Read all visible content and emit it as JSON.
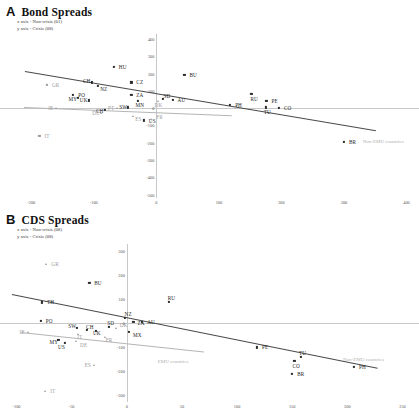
{
  "figure": {
    "panels": [
      {
        "letter": "A",
        "title": "Bond Spreads",
        "note_x": "x axis - Non-crisis (01)",
        "note_y": "y axis - Crisis (08)",
        "group_labels": {
          "non_emu": "Non-EMU countries",
          "emu": ""
        }
      },
      {
        "letter": "B",
        "title": "CDS Spreads",
        "note_x": "x axis - Non-crisis (08)",
        "note_y": "y axis - Crisis (08)",
        "group_labels": {
          "non_emu": "Non-EMU countries",
          "emu": "EMU countries"
        }
      }
    ]
  },
  "chart_data": [
    {
      "type": "scatter",
      "title": "Bond Spreads",
      "xlabel": "x axis - Non-crisis (01)",
      "ylabel": "y axis - Crisis (08)",
      "xlim": [
        -250,
        420
      ],
      "ylim": [
        -520,
        430
      ],
      "xticks": [
        -200,
        -100,
        0,
        100,
        200,
        300,
        400
      ],
      "yticks": [
        400,
        300,
        200,
        100,
        0,
        -100,
        -200,
        -300,
        -400,
        -500
      ],
      "grid": false,
      "legend": "none",
      "points": [
        {
          "label": "HU",
          "x": -68,
          "y": 240,
          "marker": "square",
          "group": "non-emu"
        },
        {
          "label": "BU",
          "x": 45,
          "y": 195,
          "marker": "square",
          "group": "non-emu"
        },
        {
          "label": "CH",
          "x": -103,
          "y": 150,
          "marker": "square",
          "group": "non-emu"
        },
        {
          "label": "NZ",
          "x": -93,
          "y": 128,
          "marker": "square",
          "group": "non-emu"
        },
        {
          "label": "CZ",
          "x": -40,
          "y": 150,
          "marker": "square",
          "group": "non-emu"
        },
        {
          "label": "GR",
          "x": -175,
          "y": 137,
          "marker": "square",
          "group": "emu"
        },
        {
          "label": "PO",
          "x": -133,
          "y": 78,
          "marker": "square",
          "group": "non-emu"
        },
        {
          "label": "ZA",
          "x": -40,
          "y": 78,
          "marker": "square",
          "group": "non-emu"
        },
        {
          "label": "MY",
          "x": -126,
          "y": 60,
          "marker": "square",
          "group": "non-emu"
        },
        {
          "label": "UK",
          "x": -108,
          "y": 45,
          "marker": "square",
          "group": "non-emu"
        },
        {
          "label": "MN",
          "x": -30,
          "y": 42,
          "marker": "square",
          "group": "non-emu"
        },
        {
          "label": "SD",
          "x": 10,
          "y": 52,
          "marker": "square",
          "group": "non-emu"
        },
        {
          "label": "AU",
          "x": 26,
          "y": 48,
          "marker": "square",
          "group": "non-emu"
        },
        {
          "label": "DK",
          "x": 2,
          "y": 40,
          "marker": "triangle",
          "group": "emu"
        },
        {
          "label": "RU",
          "x": 152,
          "y": 82,
          "marker": "square",
          "group": "non-emu"
        },
        {
          "label": "PE",
          "x": 176,
          "y": 44,
          "marker": "square",
          "group": "non-emu"
        },
        {
          "label": "PH",
          "x": 118,
          "y": 18,
          "marker": "square",
          "group": "non-emu"
        },
        {
          "label": "SW",
          "x": -45,
          "y": 5,
          "marker": "square",
          "group": "non-emu"
        },
        {
          "label": "PT",
          "x": -63,
          "y": 2,
          "marker": "triangle",
          "group": "emu"
        },
        {
          "label": "CH2",
          "x": -82,
          "y": -12,
          "marker": "square",
          "group": "non-emu"
        },
        {
          "label": "IE",
          "x": -160,
          "y": 0,
          "marker": "triangle",
          "group": "emu"
        },
        {
          "label": "DE",
          "x": -88,
          "y": -28,
          "marker": "triangle",
          "group": "emu"
        },
        {
          "label": "TU",
          "x": 175,
          "y": 5,
          "marker": "square",
          "group": "non-emu"
        },
        {
          "label": "CO",
          "x": 196,
          "y": 3,
          "marker": "square",
          "group": "non-emu"
        },
        {
          "label": "ES",
          "x": -37,
          "y": -45,
          "marker": "triangle",
          "group": "emu"
        },
        {
          "label": "US",
          "x": -20,
          "y": -70,
          "marker": "square",
          "group": "non-emu"
        },
        {
          "label": "FR",
          "x": -8,
          "y": -62,
          "marker": "triangle",
          "group": "emu"
        },
        {
          "label": "IT",
          "x": -187,
          "y": -160,
          "marker": "square",
          "group": "emu"
        },
        {
          "label": "BR",
          "x": 300,
          "y": -196,
          "marker": "square",
          "group": "non-emu"
        }
      ],
      "fit_lines": [
        {
          "name": "non-emu",
          "x1": -210,
          "y1": 216,
          "x2": 352,
          "y2": -128
        },
        {
          "name": "emu",
          "x1": -212,
          "y1": 6,
          "x2": 120,
          "y2": -42
        }
      ]
    },
    {
      "type": "scatter",
      "title": "CDS Spreads",
      "xlabel": "x axis - Non-crisis (08)",
      "ylabel": "y axis - Crisis (08)",
      "xlim": [
        -115,
        265
      ],
      "ylim": [
        -330,
        330
      ],
      "xticks": [
        -100,
        -50,
        0,
        50,
        100,
        150,
        200,
        250
      ],
      "yticks": [
        300,
        200,
        100,
        0,
        -100,
        -200,
        -300
      ],
      "grid": false,
      "legend": "none",
      "points": [
        {
          "label": "GR",
          "x": -73,
          "y": 248,
          "marker": "triangle",
          "group": "emu"
        },
        {
          "label": "BU",
          "x": -34,
          "y": 166,
          "marker": "square",
          "group": "non-emu"
        },
        {
          "label": "RU",
          "x": 38,
          "y": 88,
          "marker": "square",
          "group": "non-emu"
        },
        {
          "label": "TH",
          "x": -77,
          "y": 86,
          "marker": "square",
          "group": "non-emu"
        },
        {
          "label": "PO",
          "x": -78,
          "y": 8,
          "marker": "square",
          "group": "non-emu"
        },
        {
          "label": "NZ",
          "x": -2,
          "y": 20,
          "marker": "square",
          "group": "non-emu"
        },
        {
          "label": "ZA",
          "x": 6,
          "y": 4,
          "marker": "square",
          "group": "non-emu"
        },
        {
          "label": "AU",
          "x": 14,
          "y": 4,
          "marker": "square",
          "group": "non-emu"
        },
        {
          "label": "SD",
          "x": -16,
          "y": -18,
          "marker": "square",
          "group": "non-emu"
        },
        {
          "label": "DK",
          "x": -10,
          "y": -20,
          "marker": "triangle",
          "group": "emu"
        },
        {
          "label": "SW",
          "x": -45,
          "y": -22,
          "marker": "square",
          "group": "non-emu"
        },
        {
          "label": "CH",
          "x": -36,
          "y": -30,
          "marker": "square",
          "group": "non-emu"
        },
        {
          "label": "UK",
          "x": -28,
          "y": -32,
          "marker": "square",
          "group": "non-emu"
        },
        {
          "label": "MX",
          "x": 2,
          "y": -36,
          "marker": "square",
          "group": "non-emu"
        },
        {
          "label": "IE",
          "x": -90,
          "y": -36,
          "marker": "triangle",
          "group": "emu"
        },
        {
          "label": "IT",
          "x": -44,
          "y": -44,
          "marker": "triangle",
          "group": "emu"
        },
        {
          "label": "FR",
          "x": -20,
          "y": -58,
          "marker": "triangle",
          "group": "emu"
        },
        {
          "label": "MY",
          "x": -62,
          "y": -70,
          "marker": "square",
          "group": "non-emu"
        },
        {
          "label": "US",
          "x": -56,
          "y": -84,
          "marker": "square",
          "group": "non-emu"
        },
        {
          "label": "DE",
          "x": -46,
          "y": -76,
          "marker": "triangle",
          "group": "emu"
        },
        {
          "label": "ES",
          "x": -30,
          "y": -176,
          "marker": "triangle",
          "group": "emu"
        },
        {
          "label": "PE",
          "x": 118,
          "y": -102,
          "marker": "square",
          "group": "non-emu"
        },
        {
          "label": "TU",
          "x": 158,
          "y": -142,
          "marker": "square",
          "group": "non-emu"
        },
        {
          "label": "CO",
          "x": 152,
          "y": -160,
          "marker": "square",
          "group": "non-emu"
        },
        {
          "label": "PH",
          "x": 206,
          "y": -184,
          "marker": "square",
          "group": "non-emu"
        },
        {
          "label": "BR",
          "x": 150,
          "y": -212,
          "marker": "square",
          "group": "non-emu"
        },
        {
          "label": "IT2",
          "x": -74,
          "y": -286,
          "marker": "triangle",
          "group": "emu"
        }
      ],
      "fit_lines": [
        {
          "name": "non-emu",
          "x1": -104,
          "y1": 122,
          "x2": 228,
          "y2": -186
        },
        {
          "name": "emu",
          "x1": -96,
          "y1": -38,
          "x2": 70,
          "y2": -120
        }
      ]
    }
  ]
}
